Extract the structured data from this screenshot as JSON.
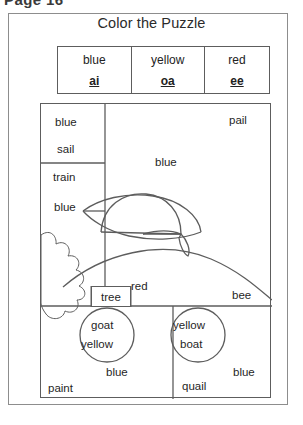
{
  "scan": {
    "header_text": "Page 16"
  },
  "worksheet": {
    "title": "Color the Puzzle"
  },
  "legend": {
    "items": [
      {
        "color": "blue",
        "sound": "ai"
      },
      {
        "color": "yellow",
        "sound": "oa"
      },
      {
        "color": "red",
        "sound": "ee"
      }
    ]
  },
  "puzzle": {
    "labels": [
      {
        "name": "label-blue-top-left",
        "text": "blue"
      },
      {
        "name": "label-sail",
        "text": "sail"
      },
      {
        "name": "label-train",
        "text": "train"
      },
      {
        "name": "label-blue-left-mid",
        "text": "blue"
      },
      {
        "name": "label-pail",
        "text": "pail"
      },
      {
        "name": "label-blue-sky",
        "text": "blue"
      },
      {
        "name": "label-red",
        "text": "red"
      },
      {
        "name": "label-tree",
        "text": "tree"
      },
      {
        "name": "label-bee",
        "text": "bee"
      },
      {
        "name": "label-goat",
        "text": "goat"
      },
      {
        "name": "label-yellow-goat",
        "text": "yellow"
      },
      {
        "name": "label-yellow-boat",
        "text": "yellow"
      },
      {
        "name": "label-boat",
        "text": "boat"
      },
      {
        "name": "label-blue-bottom-left",
        "text": "blue"
      },
      {
        "name": "label-paint",
        "text": "paint"
      },
      {
        "name": "label-quail",
        "text": "quail"
      },
      {
        "name": "label-blue-bottom-right",
        "text": "blue"
      }
    ]
  },
  "colors": {
    "ink": "#1f1f1f",
    "line": "#5d5d5d",
    "sheet_border": "#8d8d8d",
    "paper": "#ffffff"
  }
}
